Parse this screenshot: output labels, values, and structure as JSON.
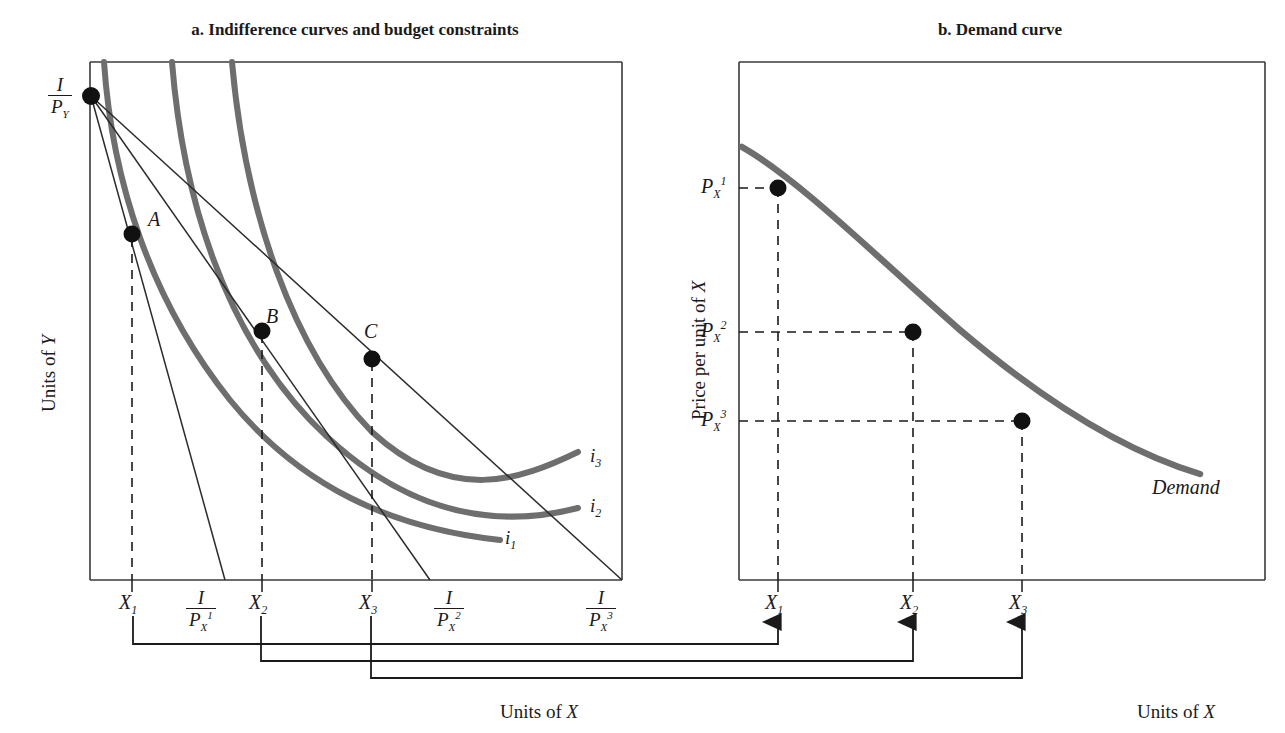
{
  "figure": {
    "panel_a_title": "a. Indifference curves and budget constraints",
    "panel_b_title": "b. Demand curve",
    "colors": {
      "curve": "#6e6e6e",
      "line": "#2b2b2b",
      "frame": "#3a3a3a",
      "point": "#111111",
      "background": "#ffffff"
    }
  },
  "panel_a": {
    "name": "indifference-curves-and-budget-constraints",
    "y_axis_label": "Units of Y",
    "x_axis_label": "Units of X",
    "y_intercept_label": {
      "numerator": "I",
      "denominator": "P",
      "den_sub": "Y"
    },
    "points": [
      {
        "id": "A",
        "label": "A",
        "x_tick": "X",
        "x_sub": "1"
      },
      {
        "id": "B",
        "label": "B",
        "x_tick": "X",
        "x_sub": "2"
      },
      {
        "id": "C",
        "label": "C",
        "x_tick": "X",
        "x_sub": "3"
      }
    ],
    "x_ticks": [
      {
        "label": "X",
        "sub": "1"
      },
      {
        "label": "X",
        "sub": "2"
      },
      {
        "label": "X",
        "sub": "3"
      }
    ],
    "budget_intercepts": [
      {
        "numerator": "I",
        "denominator": "P",
        "den_sub": "X",
        "den_sup": "1"
      },
      {
        "numerator": "I",
        "denominator": "P",
        "den_sub": "X",
        "den_sup": "2"
      },
      {
        "numerator": "I",
        "denominator": "P",
        "den_sub": "X",
        "den_sup": "3"
      }
    ],
    "curve_labels": [
      {
        "label": "i",
        "sub": "1"
      },
      {
        "label": "i",
        "sub": "2"
      },
      {
        "label": "i",
        "sub": "3"
      }
    ]
  },
  "panel_b": {
    "name": "demand-curve",
    "y_axis_label": "Price per unit of X",
    "x_axis_label": "Units of X",
    "curve_label": "Demand",
    "y_ticks": [
      {
        "label": "P",
        "sub": "X",
        "sup": "1"
      },
      {
        "label": "P",
        "sub": "X",
        "sup": "2"
      },
      {
        "label": "P",
        "sub": "X",
        "sup": "3"
      }
    ],
    "x_ticks": [
      {
        "label": "X",
        "sub": "1"
      },
      {
        "label": "X",
        "sub": "2"
      },
      {
        "label": "X",
        "sub": "3"
      }
    ]
  },
  "chart_data": {
    "type": "line",
    "panels": [
      {
        "key": "a",
        "title": "a. Indifference curves and budget constraints",
        "xlabel": "Units of X",
        "ylabel": "Units of Y",
        "equilibria": [
          {
            "point": "A",
            "x": "X1",
            "curve": "i1",
            "budget": "I/Px^1"
          },
          {
            "point": "B",
            "x": "X2",
            "curve": "i2",
            "budget": "I/Px^2"
          },
          {
            "point": "C",
            "x": "X3",
            "curve": "i3",
            "budget": "I/Px^3"
          }
        ],
        "y_intercept": "I/Py",
        "x_intercepts": [
          "I/Px^1",
          "I/Px^2",
          "I/Px^3"
        ],
        "indifference_curves": [
          "i1",
          "i2",
          "i3"
        ]
      },
      {
        "key": "b",
        "title": "b. Demand curve",
        "xlabel": "Units of X",
        "ylabel": "Price per unit of X",
        "series": [
          {
            "name": "Demand",
            "points": [
              {
                "x": "X1",
                "y": "Px^1"
              },
              {
                "x": "X2",
                "y": "Px^2"
              },
              {
                "x": "X3",
                "y": "Px^3"
              }
            ]
          }
        ]
      }
    ]
  }
}
